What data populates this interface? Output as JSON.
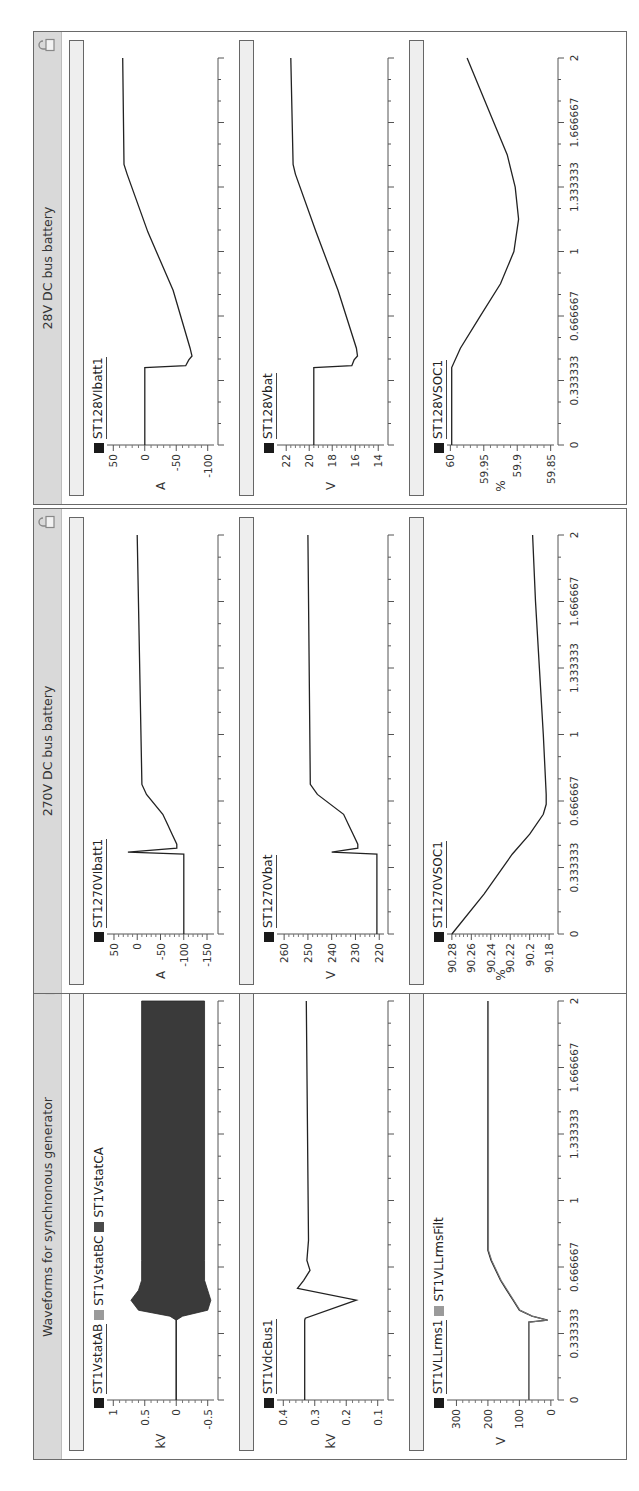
{
  "page": {
    "orientation": "rotated -90deg (landscape dashboard shown sideways)",
    "panels": [
      {
        "id": "generator",
        "title": "Waveforms for synchronous generator"
      },
      {
        "id": "dc270",
        "title": "270V DC bus battery"
      },
      {
        "id": "dc28",
        "title": "28V DC bus battery"
      }
    ],
    "x_ticks": [
      "0",
      "0.333333",
      "0.666667",
      "1",
      "1.333333",
      "1.666667",
      "2"
    ]
  },
  "chart_data": [
    {
      "panel": "Waveforms for synchronous generator",
      "type": "area",
      "title": "",
      "legend": [
        "ST1VstatAB",
        "ST1VstatBC",
        "ST1VstatCA"
      ],
      "legend_colors": [
        "#1a1a1a",
        "#9a9a9a",
        "#4a4a4a"
      ],
      "ylabel": "kV",
      "ylim": [
        -0.6,
        1.1
      ],
      "yticks": [
        "1",
        "0.5",
        "0",
        "-0.5"
      ],
      "xlim": [
        0,
        2
      ],
      "series": [
        {
          "name": "ST1VstatAB/BC/CA envelope",
          "x": [
            0,
            0.4,
            0.42,
            0.45,
            0.5,
            0.55,
            0.6,
            0.7,
            2
          ],
          "upper": [
            0,
            0,
            0.1,
            0.6,
            0.72,
            0.6,
            0.55,
            0.55,
            0.55
          ],
          "lower": [
            0,
            0,
            -0.1,
            -0.5,
            -0.55,
            -0.5,
            -0.45,
            -0.45,
            -0.45
          ]
        }
      ]
    },
    {
      "panel": "Waveforms for synchronous generator",
      "type": "line",
      "legend": [
        "ST1VdcBus1"
      ],
      "legend_colors": [
        "#1a1a1a"
      ],
      "ylabel": "kV",
      "ylim": [
        0.08,
        0.42
      ],
      "yticks": [
        "0.4",
        "0.3",
        "0.2",
        "0.1"
      ],
      "xlim": [
        0,
        2
      ],
      "series": [
        {
          "name": "ST1VdcBus1",
          "x": [
            0,
            0.4,
            0.41,
            0.5,
            0.56,
            0.6,
            0.65,
            0.7,
            0.8,
            2
          ],
          "y": [
            0.332,
            0.332,
            0.33,
            0.168,
            0.355,
            0.335,
            0.315,
            0.325,
            0.32,
            0.327
          ]
        }
      ]
    },
    {
      "panel": "Waveforms for synchronous generator",
      "type": "line",
      "legend": [
        "ST1VLLrms1",
        "ST1VLLrmsFilt"
      ],
      "legend_colors": [
        "#1a1a1a",
        "#9a9a9a"
      ],
      "ylabel": "V",
      "ylim": [
        -10,
        330
      ],
      "yticks": [
        "300",
        "200",
        "100",
        "0"
      ],
      "xlim": [
        0,
        2
      ],
      "series": [
        {
          "name": "ST1VLLrms1",
          "x": [
            0,
            0.39,
            0.4,
            0.42,
            0.45,
            0.5,
            0.55,
            0.6,
            0.7,
            0.75,
            2
          ],
          "y": [
            70,
            70,
            10,
            60,
            100,
            120,
            140,
            160,
            190,
            200,
            200
          ]
        },
        {
          "name": "ST1VLLrmsFilt",
          "x": [
            0,
            0.39,
            0.4,
            0.42,
            0.45,
            0.5,
            0.55,
            0.6,
            0.7,
            0.75,
            2
          ],
          "y": [
            70,
            70,
            12,
            58,
            98,
            118,
            138,
            158,
            188,
            198,
            198
          ]
        }
      ]
    },
    {
      "panel": "270V DC bus battery",
      "type": "line",
      "legend": [
        "ST1270VIbatt1"
      ],
      "legend_colors": [
        "#1a1a1a"
      ],
      "ylabel": "A",
      "ylim": [
        -165,
        65
      ],
      "yticks": [
        "50",
        "0",
        "-50",
        "-100",
        "-150"
      ],
      "xlim": [
        0,
        2
      ],
      "series": [
        {
          "name": "ST1270VIbatt1",
          "x": [
            0,
            0.4,
            0.41,
            0.43,
            0.45,
            0.5,
            0.55,
            0.6,
            0.7,
            0.75,
            2
          ],
          "y": [
            -100,
            -100,
            20,
            -85,
            -85,
            -75,
            -65,
            -55,
            -20,
            -10,
            0
          ]
        }
      ]
    },
    {
      "panel": "270V DC bus battery",
      "type": "line",
      "legend": [
        "ST1270Vbat"
      ],
      "legend_colors": [
        "#1a1a1a"
      ],
      "ylabel": "V",
      "ylim": [
        218,
        263
      ],
      "yticks": [
        "260",
        "250",
        "240",
        "230",
        "220"
      ],
      "xlim": [
        0,
        2
      ],
      "series": [
        {
          "name": "ST1270Vbat",
          "x": [
            0,
            0.4,
            0.41,
            0.43,
            0.45,
            0.5,
            0.55,
            0.6,
            0.7,
            0.75,
            2
          ],
          "y": [
            221,
            221,
            240,
            229,
            229,
            231,
            233,
            235,
            246,
            249,
            250
          ]
        }
      ]
    },
    {
      "panel": "270V DC bus battery",
      "type": "line",
      "legend": [
        "ST1270VSOC1"
      ],
      "legend_colors": [
        "#1a1a1a"
      ],
      "ylabel": "%",
      "ylim": [
        90.175,
        90.285
      ],
      "yticks": [
        "90.28",
        "90.26",
        "90.24",
        "90.22",
        "90.2",
        "90.18"
      ],
      "xlim": [
        0,
        2
      ],
      "series": [
        {
          "name": "ST1270VSOC1",
          "x": [
            0,
            0.2,
            0.4,
            0.5,
            0.6,
            0.65,
            0.7,
            1.0,
            1.333,
            1.667,
            2
          ],
          "y": [
            90.28,
            90.247,
            90.218,
            90.2,
            90.186,
            90.183,
            90.183,
            90.186,
            90.19,
            90.194,
            90.197
          ]
        }
      ]
    },
    {
      "panel": "28V DC bus battery",
      "type": "line",
      "legend": [
        "ST128VIbatt1"
      ],
      "legend_colors": [
        "#1a1a1a"
      ],
      "ylabel": "A",
      "ylim": [
        -110,
        60
      ],
      "yticks": [
        "50",
        "0",
        "-50",
        "-100"
      ],
      "xlim": [
        0,
        2
      ],
      "series": [
        {
          "name": "ST128VIbatt1",
          "x": [
            0,
            0.4,
            0.41,
            0.44,
            0.46,
            0.5,
            0.8,
            1.1,
            1.4,
            1.45,
            2
          ],
          "y": [
            0,
            0,
            -65,
            -70,
            -75,
            -72,
            -45,
            -5,
            28,
            33,
            35
          ]
        }
      ]
    },
    {
      "panel": "28V DC bus battery",
      "type": "line",
      "legend": [
        "ST128Vbat"
      ],
      "legend_colors": [
        "#1a1a1a"
      ],
      "ylabel": "V",
      "ylim": [
        13.5,
        22.8
      ],
      "yticks": [
        "22",
        "20",
        "18",
        "16",
        "14"
      ],
      "xlim": [
        0,
        2
      ],
      "series": [
        {
          "name": "ST128Vbat",
          "x": [
            0,
            0.4,
            0.41,
            0.44,
            0.46,
            0.5,
            0.8,
            1.1,
            1.4,
            1.45,
            2
          ],
          "y": [
            19.6,
            19.6,
            16.3,
            16.1,
            15.8,
            15.9,
            17.5,
            19.4,
            21.2,
            21.4,
            21.6
          ]
        }
      ]
    },
    {
      "panel": "28V DC bus battery",
      "type": "line",
      "legend": [
        "ST128VSOC1"
      ],
      "legend_colors": [
        "#1a1a1a"
      ],
      "ylabel": "%",
      "ylim": [
        59.845,
        60.005
      ],
      "yticks": [
        "60",
        "59.95",
        "59.9",
        "59.85"
      ],
      "xlim": [
        0,
        2
      ],
      "series": [
        {
          "name": "ST128VSOC1",
          "x": [
            0,
            0.4,
            0.5,
            0.667,
            0.833,
            1.0,
            1.167,
            1.333,
            1.5,
            1.667,
            2
          ],
          "y": [
            59.998,
            59.998,
            59.985,
            59.955,
            59.925,
            59.905,
            59.898,
            59.903,
            59.915,
            59.935,
            59.975
          ]
        }
      ]
    }
  ]
}
